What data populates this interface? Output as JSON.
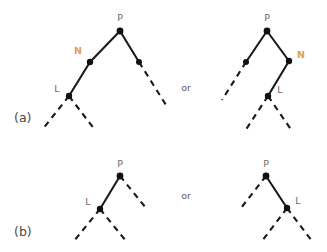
{
  "figure": {
    "background_color": "#ffffff",
    "line_color": "#1a1a1a",
    "accent_color": "#d9a15c",
    "label_color": "#6b6b6b"
  },
  "panels": [
    {
      "id": "a",
      "label": "(a)",
      "connector": "or",
      "trees": [
        {
          "id": "a-left",
          "nodes": [
            {
              "name": "P",
              "label": "P",
              "x": 120,
              "y": 31,
              "label_x": 120,
              "label_y": 21,
              "accent": false,
              "dot": true
            },
            {
              "name": "N",
              "label": "N",
              "x": 90,
              "y": 62,
              "label_x": 78,
              "label_y": 54,
              "accent": true,
              "dot": true
            },
            {
              "name": "L",
              "label": "L",
              "x": 69,
              "y": 96,
              "label_x": 57,
              "label_y": 92,
              "accent": false,
              "dot": true
            },
            {
              "name": "sister",
              "label": "",
              "x": 139,
              "y": 62,
              "label_x": 0,
              "label_y": 0,
              "accent": false,
              "dot": true
            }
          ],
          "edges": [
            {
              "name": "P-to-N",
              "x1": 120,
              "y1": 31,
              "x2": 90,
              "y2": 62,
              "style": "solid"
            },
            {
              "name": "N-to-L",
              "x1": 90,
              "y1": 62,
              "x2": 69,
              "y2": 96,
              "style": "solid"
            },
            {
              "name": "P-to-sister",
              "x1": 120,
              "y1": 31,
              "x2": 139,
              "y2": 62,
              "style": "solid"
            },
            {
              "name": "sister-descendant",
              "x1": 139,
              "y1": 62,
              "x2": 166,
              "y2": 105,
              "style": "dashed"
            },
            {
              "name": "L-child-left",
              "x1": 69,
              "y1": 96,
              "x2": 42,
              "y2": 130,
              "style": "dashed"
            },
            {
              "name": "L-child-right",
              "x1": 69,
              "y1": 96,
              "x2": 95,
              "y2": 130,
              "style": "dashed"
            }
          ]
        },
        {
          "id": "a-right",
          "nodes": [
            {
              "name": "P",
              "label": "P",
              "x": 267,
              "y": 31,
              "label_x": 267,
              "label_y": 21,
              "accent": false,
              "dot": true
            },
            {
              "name": "N",
              "label": "N",
              "x": 289,
              "y": 61,
              "label_x": 301,
              "label_y": 58,
              "accent": true,
              "dot": true
            },
            {
              "name": "L",
              "label": "L",
              "x": 268,
              "y": 96,
              "label_x": 280,
              "label_y": 93,
              "accent": false,
              "dot": true
            },
            {
              "name": "sister",
              "label": "",
              "x": 246,
              "y": 62,
              "label_x": 0,
              "label_y": 0,
              "accent": false,
              "dot": true
            }
          ],
          "edges": [
            {
              "name": "P-to-sister",
              "x1": 267,
              "y1": 31,
              "x2": 246,
              "y2": 62,
              "style": "solid"
            },
            {
              "name": "sister-descendant",
              "x1": 246,
              "y1": 62,
              "x2": 222,
              "y2": 100,
              "style": "dashed"
            },
            {
              "name": "P-to-N",
              "x1": 267,
              "y1": 31,
              "x2": 289,
              "y2": 61,
              "style": "solid"
            },
            {
              "name": "N-to-L",
              "x1": 289,
              "y1": 61,
              "x2": 268,
              "y2": 96,
              "style": "solid"
            },
            {
              "name": "L-child-left",
              "x1": 268,
              "y1": 96,
              "x2": 245,
              "y2": 131,
              "style": "dashed"
            },
            {
              "name": "L-child-right",
              "x1": 268,
              "y1": 96,
              "x2": 292,
              "y2": 131,
              "style": "dashed"
            }
          ]
        }
      ]
    },
    {
      "id": "b",
      "label": "(b)",
      "connector": "or",
      "trees": [
        {
          "id": "b-left",
          "nodes": [
            {
              "name": "P",
              "label": "P",
              "x": 120,
              "y": 176,
              "label_x": 120,
              "label_y": 167,
              "accent": false,
              "dot": true
            },
            {
              "name": "L",
              "label": "L",
              "x": 100,
              "y": 209,
              "label_x": 88,
              "label_y": 205,
              "accent": false,
              "dot": true
            }
          ],
          "edges": [
            {
              "name": "P-to-L",
              "x1": 120,
              "y1": 176,
              "x2": 100,
              "y2": 209,
              "style": "solid"
            },
            {
              "name": "P-sister-branch",
              "x1": 120,
              "y1": 176,
              "x2": 146,
              "y2": 208,
              "style": "dashed"
            },
            {
              "name": "L-child-left",
              "x1": 100,
              "y1": 209,
              "x2": 74,
              "y2": 241,
              "style": "dashed"
            },
            {
              "name": "L-child-right",
              "x1": 100,
              "y1": 209,
              "x2": 126,
              "y2": 241,
              "style": "dashed"
            }
          ]
        },
        {
          "id": "b-right",
          "nodes": [
            {
              "name": "P",
              "label": "P",
              "x": 266,
              "y": 176,
              "label_x": 266,
              "label_y": 167,
              "accent": false,
              "dot": true
            },
            {
              "name": "L",
              "label": "L",
              "x": 287,
              "y": 208,
              "label_x": 298,
              "label_y": 204,
              "accent": false,
              "dot": true
            }
          ],
          "edges": [
            {
              "name": "P-sister-branch",
              "x1": 266,
              "y1": 176,
              "x2": 241,
              "y2": 208,
              "style": "dashed"
            },
            {
              "name": "P-to-L",
              "x1": 266,
              "y1": 176,
              "x2": 287,
              "y2": 208,
              "style": "solid"
            },
            {
              "name": "L-child-left",
              "x1": 287,
              "y1": 208,
              "x2": 262,
              "y2": 241,
              "style": "dashed"
            },
            {
              "name": "L-child-right",
              "x1": 287,
              "y1": 208,
              "x2": 312,
              "y2": 241,
              "style": "dashed"
            }
          ]
        }
      ]
    }
  ],
  "panel_label_positions": [
    {
      "name": "panel-a-label",
      "x": 14,
      "y": 122
    },
    {
      "name": "panel-b-label",
      "x": 14,
      "y": 236
    }
  ],
  "connector_positions": [
    {
      "name": "or-label-a",
      "x": 186,
      "y": 91
    },
    {
      "name": "or-label-b",
      "x": 186,
      "y": 199
    }
  ]
}
